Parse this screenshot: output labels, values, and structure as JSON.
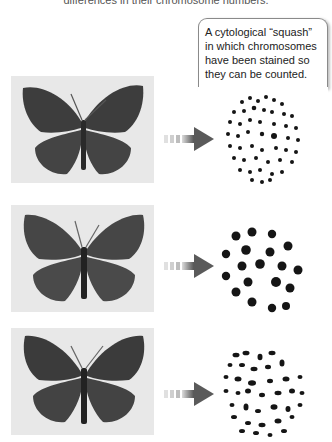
{
  "header": {
    "partial_caption": "differences in their chromosome numbers."
  },
  "callout": {
    "text": "A cytological “squash” in which chromosomes have been stained so they can be counted."
  },
  "rows": [
    {
      "specimen": "butterfly-1",
      "chromosome_pattern": "many small chromosomes"
    },
    {
      "specimen": "butterfly-2",
      "chromosome_pattern": "few large chromosomes"
    },
    {
      "specimen": "butterfly-3",
      "chromosome_pattern": "intermediate number of elongated chromosomes"
    }
  ],
  "colors": {
    "arrow_dark": "#5a5a5a",
    "arrow_light": "#d0d0d0",
    "butterfly": "#3d3d3d",
    "photo_bg": "#e6e6e6",
    "chromosome": "#151515"
  }
}
